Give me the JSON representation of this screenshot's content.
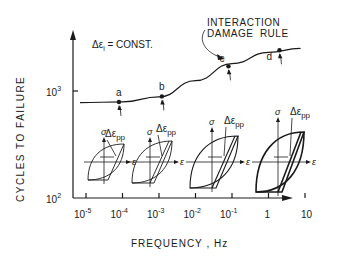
{
  "figure": {
    "annotation_const": "Δε",
    "annotation_const_sub": "i",
    "annotation_const_rest": " = CONST.",
    "rule_label_line1": "INTERACTION",
    "rule_label_line2": "DAMAGE  RULE",
    "loop_label_main": "Δε",
    "loop_label_sub": "pp",
    "stress_symbol": "σ",
    "strain_symbol": "ε"
  },
  "chart_data": {
    "type": "line",
    "title": "",
    "xlabel": "FREQUENCY , Hz",
    "ylabel": "CYCLES TO FAILURE",
    "xscale": "log",
    "yscale": "log",
    "x_tick_labels": [
      "10-5",
      "10-4",
      "10-3",
      "10-2",
      "10-1",
      "1",
      "10"
    ],
    "y_tick_labels": [
      "10^2",
      "10^3"
    ],
    "series": [
      {
        "name": "Interaction damage rule",
        "x": [
          1e-05,
          0.0001,
          0.001,
          0.01,
          0.1,
          1,
          10,
          50
        ],
        "y": [
          780,
          790,
          880,
          1250,
          1800,
          2300,
          2500,
          2520
        ]
      }
    ],
    "points": [
      {
        "label": "a",
        "x": 8e-05,
        "y": 790
      },
      {
        "label": "b",
        "x": 0.0012,
        "y": 890
      },
      {
        "label": "c",
        "x": 0.08,
        "y": 1700
      },
      {
        "label": "d",
        "x": 2.0,
        "y": 2400
      }
    ]
  },
  "axes": {
    "x_ticks": [
      {
        "base": "10",
        "exp": "-5"
      },
      {
        "base": "10",
        "exp": "-4"
      },
      {
        "base": "10",
        "exp": "-3"
      },
      {
        "base": "10",
        "exp": "-2"
      },
      {
        "base": "10",
        "exp": "-1"
      },
      {
        "base": "1",
        "exp": ""
      },
      {
        "base": "10",
        "exp": ""
      }
    ],
    "y_ticks": [
      {
        "base": "10",
        "exp": "3"
      },
      {
        "base": "10",
        "exp": "2"
      }
    ],
    "xlabel": "FREQUENCY , Hz",
    "ylabel": "CYCLES TO FAILURE"
  },
  "points": [
    "a",
    "b",
    "c",
    "d"
  ]
}
